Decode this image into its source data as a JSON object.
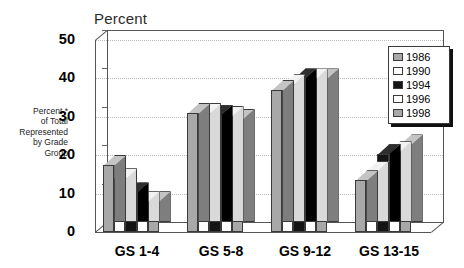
{
  "chart_data": {
    "type": "bar",
    "title": "Percent",
    "xlabel": "",
    "ylabel": "Percent * of Total Represented by Grade Group",
    "ylabel_lines": [
      "Percent *",
      "of Total",
      "Represented",
      "by Grade",
      "Group"
    ],
    "categories": [
      "GS 1-4",
      "GS 5-8",
      "GS 9-12",
      "GS 13-15"
    ],
    "ylim": [
      0,
      50
    ],
    "yticks": [
      0,
      10,
      20,
      30,
      40,
      50
    ],
    "grid": true,
    "legend_position": "top-right",
    "series": [
      {
        "name": "1986",
        "color": "#a8a8a8",
        "values": [
          17.5,
          31,
          37,
          13.5
        ]
      },
      {
        "name": "1990",
        "color": "#ffffff",
        "values": [
          14,
          31,
          38.5,
          16
        ]
      },
      {
        "name": "1994",
        "color": "#141414",
        "values": [
          10.3,
          30.5,
          40,
          20.3
        ]
      },
      {
        "name": "1996",
        "color": "#ffffff",
        "values": [
          8,
          30.3,
          40,
          21
        ]
      },
      {
        "name": "1998",
        "color": "#a8a8a8",
        "values": [
          8,
          29.5,
          40,
          22.8
        ]
      }
    ]
  },
  "colors": {
    "gray": "#a8a8a8",
    "white": "#ffffff",
    "black": "#141414",
    "gray_side": "#7e7e7e",
    "white_side": "#d9d9d9",
    "black_side": "#000000",
    "gray_top": "#c4c4c4",
    "white_top": "#f2f2f2",
    "black_top": "#2e2e2e",
    "grid": "#b9b9b9",
    "axis": "#555555",
    "text": "#000000"
  }
}
